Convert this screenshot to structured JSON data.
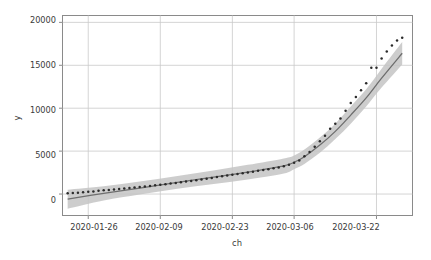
{
  "chart_data": {
    "type": "line",
    "title": "",
    "xlabel": "ch",
    "ylabel": "y",
    "grid": true,
    "legend": false,
    "xlim": [
      "2020-01-21",
      "2020-03-29"
    ],
    "ylim": [
      -2500,
      20800
    ],
    "yticks": [
      0,
      5000,
      10000,
      15000,
      20000
    ],
    "ytick_labels": [
      "0",
      "5000",
      "10000",
      "15000",
      "20000"
    ],
    "xticks": [
      "2020-01-26",
      "2020-02-09",
      "2020-02-23",
      "2020-03-06",
      "2020-03-22"
    ],
    "xtick_labels": [
      "2020-01-26",
      "2020-02-09",
      "2020-02-23",
      "2020-03-06",
      "2020-03-22"
    ],
    "colors": {
      "points": "#2b2b2b",
      "fit_line": "#6e6e6e",
      "confidence_band": "#c4c4c4",
      "grid": "#c8c8c8",
      "axis": "#8a8a8a",
      "background": "#ffffff",
      "text": "#3a3a3a"
    },
    "series": [
      {
        "name": "observed",
        "marker": "dot",
        "x": [
          "2020-01-22",
          "2020-01-23",
          "2020-01-24",
          "2020-01-25",
          "2020-01-26",
          "2020-01-27",
          "2020-01-28",
          "2020-01-29",
          "2020-01-30",
          "2020-01-31",
          "2020-02-01",
          "2020-02-02",
          "2020-02-03",
          "2020-02-04",
          "2020-02-05",
          "2020-02-06",
          "2020-02-07",
          "2020-02-08",
          "2020-02-09",
          "2020-02-10",
          "2020-02-11",
          "2020-02-12",
          "2020-02-13",
          "2020-02-14",
          "2020-02-15",
          "2020-02-16",
          "2020-02-17",
          "2020-02-18",
          "2020-02-19",
          "2020-02-20",
          "2020-02-21",
          "2020-02-22",
          "2020-02-23",
          "2020-02-24",
          "2020-02-25",
          "2020-02-26",
          "2020-02-27",
          "2020-02-28",
          "2020-02-29",
          "2020-03-01",
          "2020-03-02",
          "2020-03-03",
          "2020-03-04",
          "2020-03-05",
          "2020-03-06",
          "2020-03-07",
          "2020-03-08",
          "2020-03-09",
          "2020-03-10",
          "2020-03-11",
          "2020-03-12",
          "2020-03-13",
          "2020-03-14",
          "2020-03-15",
          "2020-03-16",
          "2020-03-17",
          "2020-03-18",
          "2020-03-19",
          "2020-03-20",
          "2020-03-21",
          "2020-03-22",
          "2020-03-23",
          "2020-03-24",
          "2020-03-25",
          "2020-03-26",
          "2020-03-27"
        ],
        "y": [
          80,
          120,
          160,
          200,
          260,
          310,
          380,
          430,
          480,
          540,
          600,
          660,
          700,
          760,
          820,
          880,
          950,
          1020,
          1080,
          1150,
          1230,
          1300,
          1380,
          1450,
          1530,
          1620,
          1700,
          1790,
          1880,
          1980,
          2060,
          2150,
          2240,
          2330,
          2420,
          2510,
          2600,
          2700,
          2800,
          2900,
          3000,
          3100,
          3250,
          3400,
          3650,
          3900,
          4400,
          4900,
          5500,
          6150,
          6800,
          7600,
          8200,
          8800,
          9700,
          10600,
          11300,
          12100,
          12900,
          14700,
          14700,
          15800,
          16600,
          17300,
          17900,
          18200
        ]
      },
      {
        "name": "fit",
        "marker": "line",
        "x": [
          "2020-01-22",
          "2020-01-29",
          "2020-02-05",
          "2020-02-12",
          "2020-02-19",
          "2020-02-26",
          "2020-03-04",
          "2020-03-06",
          "2020-03-08",
          "2020-03-11",
          "2020-03-14",
          "2020-03-17",
          "2020-03-20",
          "2020-03-23",
          "2020-03-27"
        ],
        "y": [
          -600,
          80,
          700,
          1330,
          1930,
          2550,
          3280,
          3700,
          4350,
          5700,
          7300,
          9200,
          11200,
          13500,
          16400
        ]
      },
      {
        "name": "confidence-upper",
        "marker": "band",
        "x": [
          "2020-01-22",
          "2020-01-29",
          "2020-02-05",
          "2020-02-12",
          "2020-02-19",
          "2020-02-26",
          "2020-03-04",
          "2020-03-06",
          "2020-03-08",
          "2020-03-11",
          "2020-03-14",
          "2020-03-17",
          "2020-03-20",
          "2020-03-23",
          "2020-03-27"
        ],
        "y": [
          500,
          900,
          1450,
          2080,
          2720,
          3400,
          4150,
          4500,
          5200,
          6600,
          8200,
          10200,
          12200,
          14600,
          17700
        ]
      },
      {
        "name": "confidence-lower",
        "marker": "band",
        "x": [
          "2020-01-22",
          "2020-01-29",
          "2020-02-05",
          "2020-02-12",
          "2020-02-19",
          "2020-02-26",
          "2020-03-04",
          "2020-03-06",
          "2020-03-08",
          "2020-03-11",
          "2020-03-14",
          "2020-03-17",
          "2020-03-20",
          "2020-03-23",
          "2020-03-27"
        ],
        "y": [
          -1700,
          -740,
          -50,
          580,
          1140,
          1700,
          2400,
          2900,
          3500,
          4800,
          6400,
          8200,
          10200,
          12400,
          15100
        ]
      }
    ],
    "annotations": []
  },
  "axes": {
    "ylabel": "y",
    "xlabel": "ch",
    "ytick_0": "0",
    "ytick_1": "5000",
    "ytick_2": "10000",
    "ytick_3": "15000",
    "ytick_4": "20000",
    "xtick_0": "2020-01-26",
    "xtick_1": "2020-02-09",
    "xtick_2": "2020-02-23",
    "xtick_3": "2020-03-06",
    "xtick_4": "2020-03-22"
  }
}
